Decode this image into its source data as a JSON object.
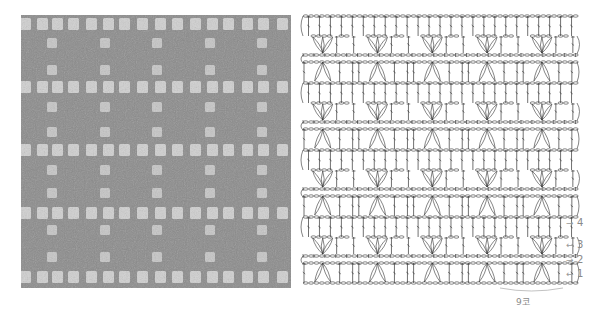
{
  "figure": {
    "photo": {
      "description": "crocheted swatch, grey yarn, filet mesh with shell rows",
      "colors": {
        "yarn": "#8b8b8b",
        "yarn_dark": "#6f6f6f",
        "opening": "#d0d0d0"
      },
      "mesh_rows_y": [
        24,
        87,
        150,
        213,
        277
      ],
      "mesh_cols_x": [
        25,
        42,
        57,
        73,
        91,
        108,
        124,
        142,
        160,
        177,
        195,
        212,
        228,
        247,
        263,
        282
      ],
      "sparse_rows_y": [
        43,
        70,
        107,
        132,
        170,
        193,
        230,
        257
      ],
      "sparse_cols_x": [
        52,
        105,
        157,
        210,
        262
      ]
    },
    "chart": {
      "repeats": 5,
      "repeat_width": 54.8,
      "origin_x": 303,
      "foundation_y": 283,
      "band_height": 67,
      "bands": 4,
      "stroke": "#333333",
      "row_labels": [
        {
          "label": "4",
          "arrow": "→",
          "y": 218
        },
        {
          "label": "3",
          "arrow": "←",
          "y": 240
        },
        {
          "label": "2",
          "arrow": "→",
          "y": 255
        },
        {
          "label": "1",
          "arrow": "←",
          "y": 269
        }
      ],
      "stitch_count_label": "9코"
    }
  }
}
